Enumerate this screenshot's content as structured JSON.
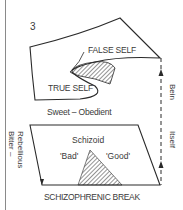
{
  "figure": {
    "number": "3",
    "upper_sheet": {
      "top_label": "FALSE SELF",
      "inner_label": "TRUE SELF"
    },
    "lower_sheet": {
      "top_edge_label": "Sweet – Obedient",
      "left_edge_label_line1": "Bitter –",
      "left_edge_label_line2": "Rebellious",
      "center_label": "Schizoid",
      "left_region_label": "'Bad'",
      "right_region_label": "'Good'",
      "bottom_label": "SCHIZOPHRENIC BREAK"
    },
    "side_arrow": {
      "label_upper": "Bein",
      "label_lower": "Itself"
    },
    "colors": {
      "line": "#2a2a2a",
      "text": "#3a3a3a",
      "background": "#ffffff",
      "hatch": "#2a2a2a"
    }
  }
}
